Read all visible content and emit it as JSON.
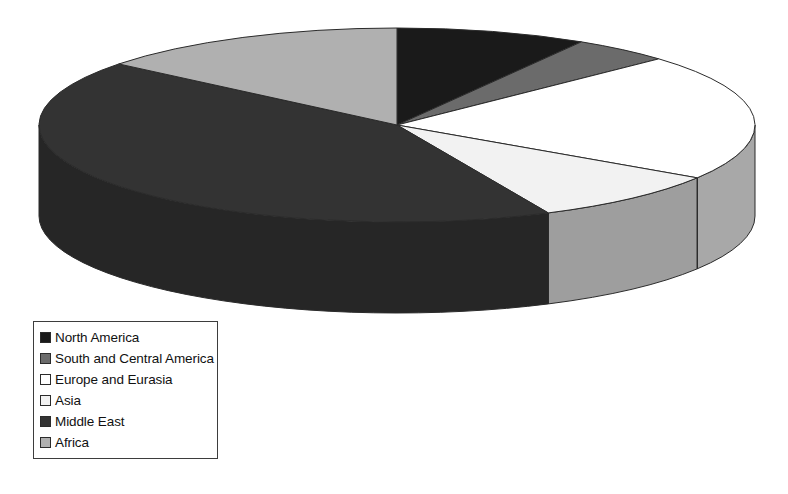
{
  "chart_data": {
    "type": "pie",
    "title": "",
    "subtitle": "",
    "xlabel": "",
    "ylabel": "",
    "grid": false,
    "three_d": true,
    "legend_position": "bottom-left",
    "categories": [
      "North America",
      "South and Central America",
      "Europe and Eurasia",
      "Asia",
      "Middle East",
      "Africa"
    ],
    "values": [
      8.6,
      4.4,
      21.1,
      8.9,
      42.8,
      14.2
    ],
    "units": "percent",
    "colors": [
      "#1a1a1a",
      "#6b6b6b",
      "#ffffff",
      "#f2f2f2",
      "#333333",
      "#b0b0b0"
    ],
    "slices": [
      {
        "label": "North America",
        "value": 8.6,
        "color": "#1a1a1a",
        "side_color": "#141414",
        "start_angle": 0,
        "end_angle": 31
      },
      {
        "label": "South and Central America",
        "value": 4.4,
        "color": "#6b6b6b",
        "side_color": "#5a5a5a",
        "start_angle": 31,
        "end_angle": 47
      },
      {
        "label": "Europe and Eurasia",
        "value": 21.1,
        "color": "#ffffff",
        "side_color": "#a8a8a8",
        "start_angle": 47,
        "end_angle": 123
      },
      {
        "label": "Asia",
        "value": 8.9,
        "color": "#f2f2f2",
        "side_color": "#9e9e9e",
        "start_angle": 123,
        "end_angle": 155
      },
      {
        "label": "Middle East",
        "value": 42.8,
        "color": "#333333",
        "side_color": "#262626",
        "start_angle": 155,
        "end_angle": 309
      },
      {
        "label": "Africa",
        "value": 14.2,
        "color": "#b0b0b0",
        "side_color": "#8f8f8f",
        "start_angle": 309,
        "end_angle": 360
      }
    ],
    "geometry": {
      "center_x": 397,
      "center_y": 125,
      "radius_x": 358,
      "radius_y": 97,
      "depth": 91
    }
  },
  "legend": {
    "items": [
      {
        "label": "North America",
        "color": "#1a1a1a"
      },
      {
        "label": "South and Central America",
        "color": "#6b6b6b"
      },
      {
        "label": "Europe and Eurasia",
        "color": "#ffffff"
      },
      {
        "label": "Asia",
        "color": "#f2f2f2"
      },
      {
        "label": "Middle East",
        "color": "#333333"
      },
      {
        "label": "Africa",
        "color": "#b0b0b0"
      }
    ]
  },
  "outline_color": "#2b2b2b",
  "background_color": "#ffffff"
}
